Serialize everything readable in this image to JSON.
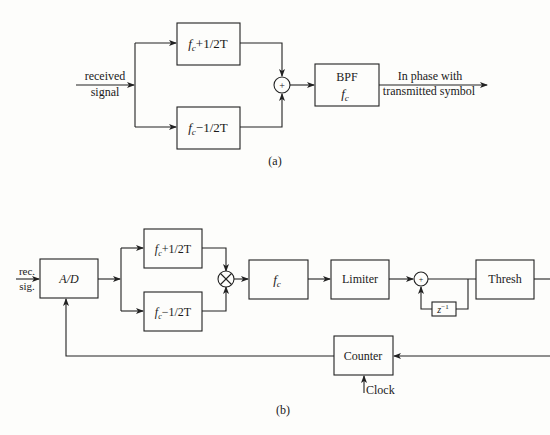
{
  "panel_a": {
    "caption": "(a)",
    "input_label_line1": "received",
    "input_label_line2": "signal",
    "filter_upper": {
      "fc": "f",
      "sub": "c",
      "rest": "+1/2T"
    },
    "filter_lower": {
      "fc": "f",
      "sub": "c",
      "rest": "−1/2T"
    },
    "combiner_symbol": "+",
    "bpf_label": "BPF",
    "bpf_freq": {
      "fc": "f",
      "sub": "c"
    },
    "output_label_line1": "In phase with",
    "output_label_line2": "transmitted symbol"
  },
  "panel_b": {
    "caption": "(b)",
    "input_label_line1": "rec.",
    "input_label_line2": "sig.",
    "adc_label": "A/D",
    "filter_upper": {
      "fc": "f",
      "sub": "c",
      "rest": "+1/2T"
    },
    "filter_lower": {
      "fc": "f",
      "sub": "c",
      "rest": "−1/2T"
    },
    "multiplier_symbol": "×",
    "fc_filter": {
      "fc": "f",
      "sub": "c"
    },
    "limiter_label": "Limiter",
    "summer_symbol": "+",
    "delay_label": {
      "z": "z",
      "exp": "−1"
    },
    "thresh_label": "Thresh",
    "counter_label": "Counter",
    "clock_label": "Clock"
  }
}
